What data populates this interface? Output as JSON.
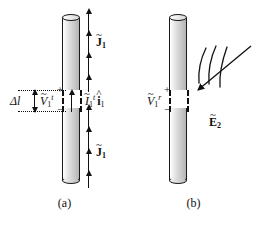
{
  "figure": {
    "panels": [
      {
        "id": "a",
        "caption": "(a)",
        "labels": {
          "delta_l": "Δl",
          "voltage": {
            "tilde": "~",
            "symbol": "V",
            "sub": "1",
            "sup": "t",
            "plus": "+",
            "minus": "−"
          },
          "current": {
            "tilde": "~",
            "symbol": "I",
            "sub": "1",
            "sup": "t",
            "unit_tilde": "^",
            "unit": "i",
            "unit_sub": "1"
          },
          "current_density_upper": {
            "tilde": "~",
            "symbol": "J",
            "sub": "1"
          },
          "current_density_lower": {
            "tilde": "~",
            "symbol": "J",
            "sub": "1"
          }
        }
      },
      {
        "id": "b",
        "caption": "(b)",
        "labels": {
          "voltage": {
            "tilde": "~",
            "symbol": "V",
            "sub": "1",
            "sup": "r",
            "plus": "+",
            "minus": "−"
          },
          "incident_field": {
            "tilde": "~",
            "symbol": "E",
            "sub": "2"
          }
        }
      }
    ]
  },
  "colors": {
    "ink": "#111111",
    "rod_light": "#f2f2f2",
    "rod_mid": "#d2d2d2",
    "rod_dark": "#b4b4b4",
    "background": "#ffffff"
  }
}
